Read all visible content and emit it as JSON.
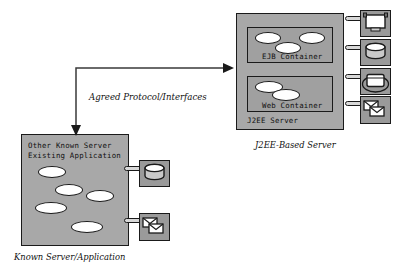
{
  "diagram": {
    "title_hidden": "",
    "colors": {
      "server_fill": "#a8a8a8",
      "container_fill": "#a0a0a0",
      "icon_fill": "#9a9a9a",
      "ellipse_fill": "#ffffff",
      "stroke": "#1a1a1a",
      "connector_fill": "#d8d8d8",
      "background": "#ffffff"
    },
    "j2ee_server": {
      "label": "J2EE Server",
      "caption": "J2EE-Based Server",
      "containers": [
        {
          "label": "EJB Container",
          "component_count": 3
        },
        {
          "label": "Web Container",
          "component_count": 2
        }
      ],
      "attached_resources": [
        {
          "icon": "monitor-icon",
          "name": "workstation"
        },
        {
          "icon": "database-icon",
          "name": "database"
        },
        {
          "icon": "network-device-icon",
          "name": "network-device"
        },
        {
          "icon": "mail-icon",
          "name": "mail-system"
        }
      ]
    },
    "known_server": {
      "label_line1": "Other Known Server",
      "label_line2": "Existing Application",
      "caption": "Known Server/Application",
      "component_count": 5,
      "attached_resources": [
        {
          "icon": "database-icon",
          "name": "database"
        },
        {
          "icon": "mail-icon",
          "name": "mail-system"
        }
      ]
    },
    "connector": {
      "label": "Agreed Protocol/Interfaces",
      "arrow_heads": 2,
      "direction": "bidirectional"
    }
  }
}
